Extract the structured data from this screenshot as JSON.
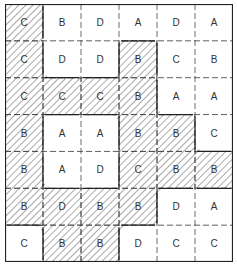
{
  "grid": {
    "rows": 7,
    "cols": 6,
    "cells": [
      [
        "C",
        "B",
        "D",
        "A",
        "D",
        "A"
      ],
      [
        "C",
        "D",
        "D",
        "B",
        "C",
        "B"
      ],
      [
        "C",
        "C",
        "C",
        "B",
        "A",
        "A"
      ],
      [
        "B",
        "A",
        "A",
        "B",
        "B",
        "C"
      ],
      [
        "B",
        "A",
        "D",
        "C",
        "B",
        "B"
      ],
      [
        "B",
        "D",
        "B",
        "B",
        "D",
        "A"
      ],
      [
        "C",
        "B",
        "B",
        "D",
        "C",
        "C"
      ]
    ],
    "hatched": [
      [
        1,
        0,
        0,
        0,
        0,
        0
      ],
      [
        1,
        0,
        0,
        1,
        0,
        0
      ],
      [
        1,
        1,
        1,
        1,
        0,
        0
      ],
      [
        1,
        0,
        0,
        1,
        1,
        0
      ],
      [
        1,
        0,
        0,
        1,
        1,
        1
      ],
      [
        1,
        1,
        1,
        1,
        0,
        0
      ],
      [
        0,
        1,
        1,
        0,
        0,
        0
      ]
    ],
    "colors": {
      "line": "#222222",
      "hatch": "#555555",
      "text": "#333333",
      "background": "#ffffff"
    }
  }
}
